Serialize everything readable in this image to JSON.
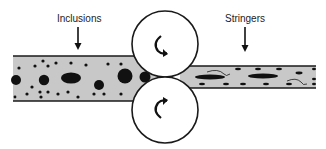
{
  "diagram": {
    "labels": {
      "inclusions": "Inclusions",
      "stringers": "Stringers"
    },
    "colors": {
      "strip_fill": "#c8c8c8",
      "outline": "#1a1a1a",
      "inclusion": "#111111",
      "roller_fill": "#ffffff",
      "background": "#ffffff"
    },
    "components": [
      {
        "id": "thick-strip",
        "description": "Incoming thick strip containing round inclusions"
      },
      {
        "id": "top-roller",
        "description": "Upper roll rotating clockwise"
      },
      {
        "id": "bottom-roller",
        "description": "Lower roll rotating counter-clockwise"
      },
      {
        "id": "thin-strip",
        "description": "Rolled thin strip with elongated stringers"
      }
    ],
    "icons": {
      "top_roller_rotation": "rotation-arrow-icon",
      "bottom_roller_rotation": "rotation-arrow-icon",
      "label_pointer": "arrow-down-icon"
    }
  }
}
